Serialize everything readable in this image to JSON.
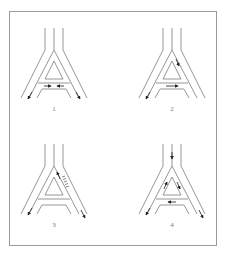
{
  "figure": {
    "frame_color": "#9a9a9a",
    "line_color": "#8a8a8a",
    "arrow_color": "#222222"
  },
  "panels": [
    {
      "label": "1",
      "arrows": [
        "inner-left-down",
        "inner-right-down",
        "crossbar-converging-left",
        "crossbar-converging-right"
      ]
    },
    {
      "label": "2",
      "arrows": [
        "upper-right-inner-down",
        "crossbar-right",
        "left-lower-down"
      ]
    },
    {
      "label": "3",
      "arrows": [
        "upper-right-up",
        "upper-right-hatched-zone",
        "right-lower-down",
        "left-lower-down"
      ]
    },
    {
      "label": "4",
      "arrows": [
        "stem-down",
        "upper-left-up",
        "upper-right-down",
        "crossbar-left",
        "left-lower-down",
        "right-lower-down"
      ]
    }
  ]
}
